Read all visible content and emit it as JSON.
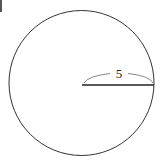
{
  "diagram": {
    "shape": "circle",
    "center": [
      81.5,
      83
    ],
    "radius": 72.5,
    "radius_line": {
      "x1": 82,
      "y1": 85,
      "x2": 154,
      "y2": 85
    },
    "radius_label": "5",
    "stroke_color": "#333333",
    "background": "#ffffff"
  }
}
